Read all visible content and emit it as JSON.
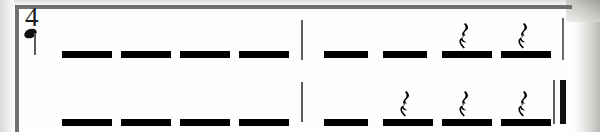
{
  "sheet": {
    "title": "Rhythm Notation Exercise",
    "notation_type": "rhythm-dashes",
    "colors": {
      "ink": "#000000",
      "rule": "#6f6f70",
      "barline": "#5e5e5e",
      "paper": "#fefefe"
    }
  },
  "time_signature": {
    "numerator": "4",
    "beat_unit_glyph": "quarter-note",
    "reading": "4 beats per measure, quarter note gets the beat"
  },
  "rows": [
    {
      "row_label": "staff-row-1",
      "end_barline": "thin",
      "measures": [
        {
          "measure_label": "measure-1",
          "beats": [
            {
              "beat": "1",
              "symbol": "dash",
              "rest": false
            },
            {
              "beat": "2",
              "symbol": "dash",
              "rest": false
            },
            {
              "beat": "3",
              "symbol": "dash",
              "rest": false
            },
            {
              "beat": "4",
              "symbol": "dash",
              "rest": false
            }
          ]
        },
        {
          "measure_label": "measure-2",
          "beats": [
            {
              "beat": "1",
              "symbol": "dash",
              "rest": false
            },
            {
              "beat": "2",
              "symbol": "dash",
              "rest": false
            },
            {
              "beat": "3",
              "symbol": "dash",
              "rest": true,
              "rest_type": "quarter-rest"
            },
            {
              "beat": "4",
              "symbol": "dash",
              "rest": true,
              "rest_type": "quarter-rest"
            }
          ]
        }
      ]
    },
    {
      "row_label": "staff-row-2",
      "end_barline": "final",
      "measures": [
        {
          "measure_label": "measure-3",
          "beats": [
            {
              "beat": "1",
              "symbol": "dash",
              "rest": false
            },
            {
              "beat": "2",
              "symbol": "dash",
              "rest": false
            },
            {
              "beat": "3",
              "symbol": "dash",
              "rest": false
            },
            {
              "beat": "4",
              "symbol": "dash",
              "rest": false
            }
          ]
        },
        {
          "measure_label": "measure-4",
          "beats": [
            {
              "beat": "1",
              "symbol": "dash",
              "rest": false
            },
            {
              "beat": "2",
              "symbol": "dash",
              "rest": true,
              "rest_type": "quarter-rest"
            },
            {
              "beat": "3",
              "symbol": "dash",
              "rest": true,
              "rest_type": "quarter-rest"
            },
            {
              "beat": "4",
              "symbol": "dash",
              "rest": true,
              "rest_type": "quarter-rest"
            }
          ]
        }
      ]
    }
  ],
  "layout": {
    "row_tops": [
      8,
      76
    ],
    "measure_1_beat_x": [
      62,
      121,
      180,
      239
    ],
    "measure_2_beat_x": [
      324,
      383,
      442,
      501
    ],
    "mid_barline_x": 301,
    "row1_end_barline_x": 562,
    "final_barline_thin_x": 556,
    "final_barline_thick_x": 563
  }
}
